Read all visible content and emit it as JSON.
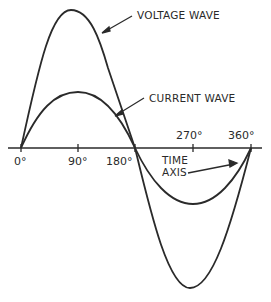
{
  "diagram": {
    "labels": {
      "voltage_wave": "VOLTAGE WAVE",
      "current_wave": "CURRENT WAVE",
      "time_axis_line1": "TIME",
      "time_axis_line2": "AXIS"
    },
    "ticks": {
      "t0": "0°",
      "t90": "90°",
      "t180": "180°",
      "t270": "270°",
      "t360": "360°"
    },
    "colors": {
      "stroke": "#2a2a2a",
      "background": "#ffffff"
    }
  }
}
